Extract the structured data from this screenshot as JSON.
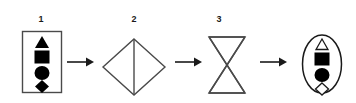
{
  "diagram": {
    "type": "shape-transformation-sequence",
    "background_color": "#ffffff",
    "stroke_color": "#1a1a1a",
    "fill_color": "#000000",
    "steps": [
      {
        "label": "1",
        "container": "rectangle",
        "container_name": "rectangle-outline",
        "contents": [
          {
            "shape": "triangle",
            "fill": "filled"
          },
          {
            "shape": "square",
            "fill": "filled"
          },
          {
            "shape": "circle",
            "fill": "filled"
          },
          {
            "shape": "diamond",
            "fill": "filled"
          }
        ]
      },
      {
        "label": "2",
        "container": "diamond-with-vertical-divider",
        "container_name": "diamond-outline",
        "contents": []
      },
      {
        "label": "3",
        "container": "hourglass-bowtie",
        "container_name": "hourglass-outline",
        "contents": []
      },
      {
        "label": "",
        "container": "ellipse",
        "container_name": "ellipse-outline",
        "contents": [
          {
            "shape": "triangle",
            "fill": "outline"
          },
          {
            "shape": "square",
            "fill": "filled"
          },
          {
            "shape": "circle",
            "fill": "filled"
          },
          {
            "shape": "diamond",
            "fill": "outline"
          }
        ]
      }
    ],
    "connectors": [
      {
        "name": "arrow-1",
        "direction": "right"
      },
      {
        "name": "arrow-2",
        "direction": "right"
      },
      {
        "name": "arrow-3",
        "direction": "right"
      }
    ]
  }
}
